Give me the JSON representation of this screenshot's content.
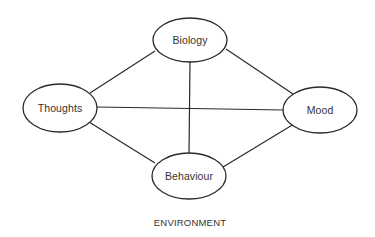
{
  "diagram": {
    "type": "network",
    "colors": {
      "stroke": "#2a2a2a",
      "text": "#333333",
      "background": "#ffffff"
    },
    "nodes": [
      {
        "id": "biology",
        "label": "Biology",
        "cx": 190,
        "cy": 40,
        "rx": 37,
        "ry": 22
      },
      {
        "id": "thoughts",
        "label": "Thoughts",
        "cx": 60,
        "cy": 108,
        "rx": 37,
        "ry": 24
      },
      {
        "id": "mood",
        "label": "Mood",
        "cx": 320,
        "cy": 110,
        "rx": 37,
        "ry": 23
      },
      {
        "id": "behaviour",
        "label": "Behaviour",
        "cx": 189,
        "cy": 176,
        "rx": 37,
        "ry": 23
      }
    ],
    "edges": [
      {
        "from": "thoughts",
        "to": "biology",
        "x1": 90,
        "y1": 93,
        "x2": 155,
        "y2": 51
      },
      {
        "from": "biology",
        "to": "mood",
        "x1": 226,
        "y1": 49,
        "x2": 293,
        "y2": 94
      },
      {
        "from": "thoughts",
        "to": "behaviour",
        "x1": 89,
        "y1": 122,
        "x2": 155,
        "y2": 163
      },
      {
        "from": "behaviour",
        "to": "mood",
        "x1": 223,
        "y1": 167,
        "x2": 294,
        "y2": 124
      },
      {
        "from": "biology",
        "to": "behaviour",
        "x1": 190,
        "y1": 62,
        "x2": 189,
        "y2": 154
      },
      {
        "from": "thoughts",
        "to": "mood",
        "x1": 97,
        "y1": 107,
        "x2": 284,
        "y2": 110
      }
    ],
    "footer": {
      "label": "ENVIRONMENT",
      "x": 190,
      "y": 222
    }
  }
}
